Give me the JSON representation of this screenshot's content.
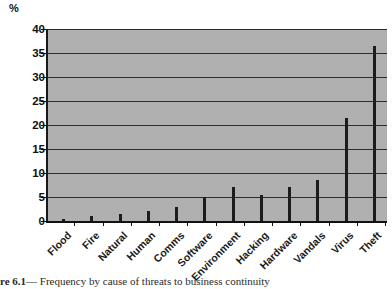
{
  "figure": {
    "caption_prefix": "re 6.1",
    "caption_dash": "—",
    "caption_text": "Frequency by cause of threats to business continuity"
  },
  "chart_data": {
    "type": "bar",
    "title": "",
    "subtitle": "",
    "xlabel": "",
    "ylabel": "%",
    "unit_label": "%",
    "ylim": [
      0,
      40
    ],
    "ytick_step": 5,
    "yticks": [
      0,
      5,
      10,
      15,
      20,
      25,
      30,
      35,
      40
    ],
    "ytick_labels": [
      "0",
      "5",
      "10",
      "15",
      "20",
      "25",
      "30",
      "35",
      "40"
    ],
    "grid": true,
    "grid_orientation": "horizontal",
    "legend": false,
    "legend_position": "none",
    "categories": [
      "Flood",
      "Fire",
      "Natural",
      "Human",
      "Comms",
      "Software",
      "Environment",
      "Hacking",
      "Hardware",
      "Vandals",
      "Virus",
      "Theft"
    ],
    "values": [
      0.5,
      1,
      1.5,
      2,
      3,
      5,
      7,
      5.5,
      7,
      8.5,
      21.5,
      36.5
    ],
    "series": [
      {
        "name": "Frequency by cause",
        "values": [
          0.5,
          1,
          1.5,
          2,
          3,
          5,
          7,
          5.5,
          7,
          8.5,
          21.5,
          36.5
        ]
      }
    ],
    "colors": {
      "bar": "#1c1c1c",
      "plot_background": "#b0b0b0",
      "gridline": "#2b2b2b",
      "axis": "#111111",
      "page_background": "#ffffff"
    }
  }
}
